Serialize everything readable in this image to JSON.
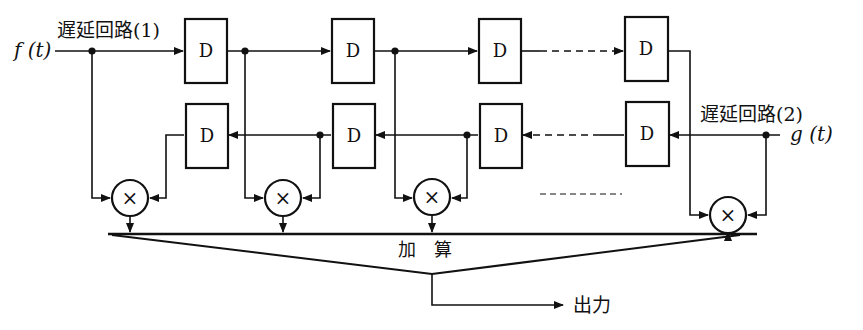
{
  "diagram": {
    "input_f": "f (t)",
    "input_g": "g (t)",
    "delay_line_1_label": "遅延回路(1)",
    "delay_line_2_label": "遅延回路(2)",
    "delay_box_label": "D",
    "multiplier_symbol": "×",
    "adder_label": "加　算",
    "output_label": "出力",
    "top_row_delays": [
      "D",
      "D",
      "D",
      "D"
    ],
    "bottom_row_delays": [
      "D",
      "D",
      "D",
      "D"
    ],
    "multipliers": [
      "×",
      "×",
      "×",
      "×"
    ],
    "colors": {
      "line": "#111111",
      "background": "#ffffff"
    }
  }
}
